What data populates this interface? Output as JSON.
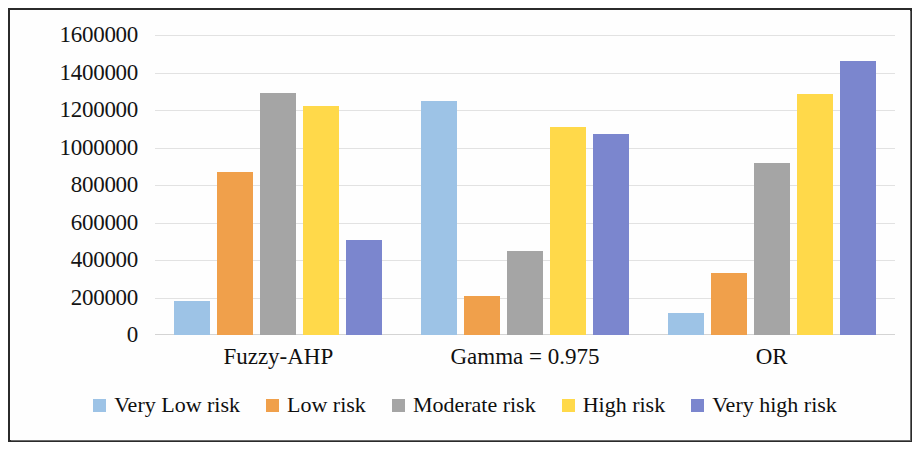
{
  "chart_data": {
    "type": "bar",
    "title": "",
    "subtitle": "",
    "xlabel": "",
    "ylabel": "Number of pixels",
    "categories": [
      "Fuzzy-AHP",
      "Gamma = 0.975",
      "OR"
    ],
    "series": [
      {
        "name": "Very Low risk",
        "color": "#9DC3E6",
        "values": [
          180000,
          1250000,
          120000
        ]
      },
      {
        "name": "Low risk",
        "color": "#F0A04B",
        "values": [
          870000,
          210000,
          330000
        ]
      },
      {
        "name": "Moderate risk",
        "color": "#A5A5A5",
        "values": [
          1290000,
          450000,
          920000
        ]
      },
      {
        "name": "High risk",
        "color": "#FFD94A",
        "values": [
          1220000,
          1110000,
          1285000
        ]
      },
      {
        "name": "Very high risk",
        "color": "#7B86CE",
        "values": [
          505000,
          1070000,
          1460000
        ]
      }
    ],
    "ylim": [
      0,
      1600000
    ],
    "ytick_step": 200000,
    "yticks": [
      "1600000",
      "1400000",
      "1200000",
      "1000000",
      "800000",
      "600000",
      "400000",
      "200000",
      "0"
    ],
    "ytick_values": [
      1600000,
      1400000,
      1200000,
      1000000,
      800000,
      600000,
      400000,
      200000,
      0
    ],
    "grid": true,
    "grid_color": "#E2E2E2",
    "legend_position": "bottom",
    "legend": [
      "Very Low risk",
      "Low risk",
      "Moderate risk",
      "High risk",
      "Very high risk"
    ],
    "border_color": "#2B2B2B",
    "background": "#FFFFFF"
  }
}
